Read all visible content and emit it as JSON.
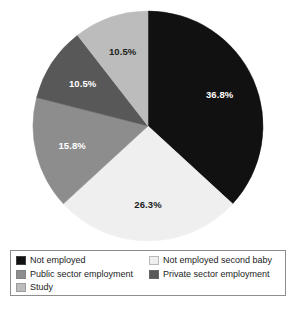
{
  "chart_data": {
    "type": "pie",
    "title": "",
    "labels": [
      "Not employed",
      "Not employed second baby",
      "Public sector employment",
      "Private sector employment",
      "Study"
    ],
    "values": [
      36.8,
      26.3,
      15.8,
      10.5,
      10.5
    ],
    "value_labels": [
      "36.8%",
      "26.3%",
      "15.8%",
      "10.5%",
      "10.5%"
    ],
    "colors": [
      "#111111",
      "#efefef",
      "#8d8d8d",
      "#585858",
      "#bcbcbc"
    ],
    "label_text_colors": [
      "#ffffff",
      "#222222",
      "#ffffff",
      "#ffffff",
      "#222222"
    ],
    "start_angle_deg": 0,
    "direction": "clockwise",
    "legend": {
      "position": "bottom",
      "columns": 2,
      "border_color": "#8d8d8d",
      "entries": [
        {
          "label": "Not employed",
          "color": "#111111"
        },
        {
          "label": "Not employed second baby",
          "color": "#efefef"
        },
        {
          "label": "Public sector employment",
          "color": "#8d8d8d"
        },
        {
          "label": "Private sector employment",
          "color": "#585858"
        },
        {
          "label": "Study",
          "color": "#bcbcbc"
        }
      ]
    },
    "geometry": {
      "center_x": 148,
      "center_y": 126,
      "radius": 115
    }
  }
}
